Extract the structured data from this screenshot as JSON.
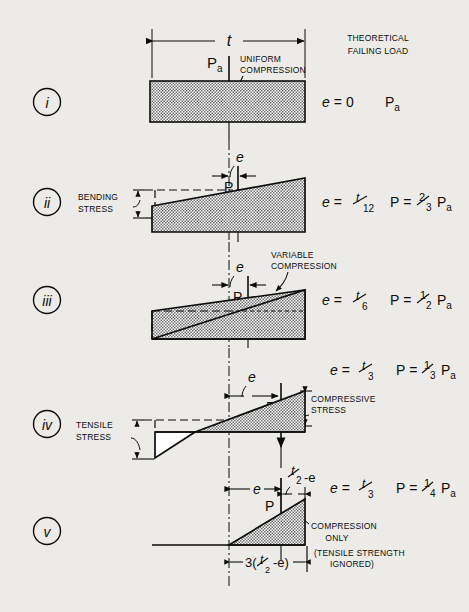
{
  "figure": {
    "background_color": "#ecebe7",
    "ink_color": "#0d0d0d",
    "hatch_color": "#8d8d8d",
    "width": 469,
    "height": 612
  },
  "header": {
    "column_title_line1": "THEORETICAL",
    "column_title_line2": "FAILING LOAD"
  },
  "dimensions": {
    "thickness_label": "t",
    "load_label": "P",
    "load_label_sub": "a",
    "eccentricity_label": "e",
    "half_minus_e_label": "t/2 -e",
    "base_width_label": "3(t/2 -e)"
  },
  "annotations": {
    "uniform_compression_line1": "UNIFORM",
    "uniform_compression_line2": "COMPRESSION",
    "bending_stress_line1": "BENDING",
    "bending_stress_line2": "STRESS",
    "variable_compression_line1": "VARIABLE",
    "variable_compression_line2": "COMPRESSION",
    "tensile_stress_line1": "TENSILE",
    "tensile_stress_line2": "STRESS",
    "compressive_stress_line1": "COMPRESSIVE",
    "compressive_stress_line2": "STRESS",
    "compression_only_line1": "COMPRESSION",
    "compression_only_line2": "ONLY",
    "tensile_ignored_line1": "(TENSILE STRENGTH",
    "tensile_ignored_line2": "IGNORED)"
  },
  "rows": [
    {
      "id": "i",
      "numeral": "i",
      "eccentricity_text": "e = 0",
      "eccentricity_e": "e",
      "eccentricity_eq": "=",
      "eccentricity_value": "0",
      "failing_load_text": "Pa",
      "failing_load_main": "P",
      "failing_load_sub": "a",
      "load_marker": "Pa",
      "stress_shape": "rectangle"
    },
    {
      "id": "ii",
      "numeral": "ii",
      "eccentricity_e": "e",
      "eccentricity_eq": "=",
      "eccentricity_value": "t/12",
      "ecc_num": "t",
      "ecc_den": "12",
      "failing_load_p": "P",
      "failing_load_eq": "=",
      "load_num": "2",
      "load_den": "3",
      "failing_load_main": "P",
      "failing_load_sub": "a",
      "load_marker": "P",
      "stress_shape": "trapezoid"
    },
    {
      "id": "iii",
      "numeral": "iii",
      "eccentricity_e": "e",
      "eccentricity_eq": "=",
      "eccentricity_value": "t/6",
      "ecc_num": "t",
      "ecc_den": "6",
      "failing_load_p": "P",
      "failing_load_eq": "=",
      "load_num": "1",
      "load_den": "2",
      "failing_load_main": "P",
      "failing_load_sub": "a",
      "load_marker": "P",
      "stress_shape": "triangle-full"
    },
    {
      "id": "iv",
      "numeral": "iv",
      "eccentricity_e": "e",
      "eccentricity_eq": "=",
      "eccentricity_value": "t/3",
      "ecc_num": "t",
      "ecc_den": "3",
      "failing_load_p": "P",
      "failing_load_eq": "=",
      "load_num": "1",
      "load_den": "3",
      "failing_load_main": "P",
      "failing_load_sub": "a",
      "load_marker": "P",
      "stress_shape": "triangle-with-tension"
    },
    {
      "id": "v",
      "numeral": "v",
      "eccentricity_e": "e",
      "eccentricity_eq": "=",
      "eccentricity_value": "t/3",
      "ecc_num": "t",
      "ecc_den": "3",
      "failing_load_p": "P",
      "failing_load_eq": "=",
      "load_num": "1",
      "load_den": "4",
      "failing_load_main": "P",
      "failing_load_sub": "a",
      "load_marker": "P",
      "stress_shape": "triangle-compression-only"
    }
  ]
}
